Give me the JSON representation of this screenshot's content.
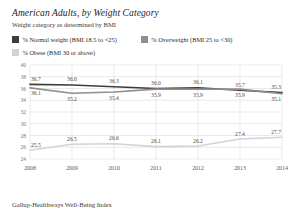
{
  "header": {
    "title": "American Adults, by Weight Category",
    "subtitle": "Weight category as determined by BMI"
  },
  "legend": [
    {
      "label": "% Normal weight (BMI 18.5 to <25)",
      "color": "#3d3d3d"
    },
    {
      "label": "% Overweight (BMI 25 to <30)",
      "color": "#8f8f8f"
    },
    {
      "label": "% Obese (BMI 30 or above)",
      "color": "#d3d3d3"
    }
  ],
  "source": "Gallup-Healthways Well-Being Index",
  "chart_data": {
    "type": "line",
    "title": "American Adults, by Weight Category",
    "subtitle": "Weight category as determined by BMI",
    "categories": [
      "2008",
      "2009",
      "2010",
      "2011",
      "2012",
      "2013",
      "2014"
    ],
    "series": [
      {
        "name": "% Normal weight (BMI 18.5 to <25)",
        "color": "#3d3d3d",
        "values": [
          36.7,
          36.6,
          36.3,
          36.0,
          36.1,
          35.7,
          35.3
        ]
      },
      {
        "name": "% Overweight (BMI 25 to <30)",
        "color": "#8f8f8f",
        "values": [
          36.1,
          35.2,
          35.4,
          35.9,
          35.9,
          35.9,
          35.1
        ]
      },
      {
        "name": "% Obese (BMI 30 or above)",
        "color": "#d3d3d3",
        "values": [
          25.5,
          26.5,
          26.6,
          26.1,
          26.2,
          27.4,
          27.7
        ]
      }
    ],
    "xlabel": "",
    "ylabel": "",
    "ylim": [
      24,
      40
    ],
    "yticks": [
      24,
      26,
      28,
      30,
      32,
      34,
      36,
      38,
      40
    ],
    "grid": true,
    "legend_position": "top"
  }
}
